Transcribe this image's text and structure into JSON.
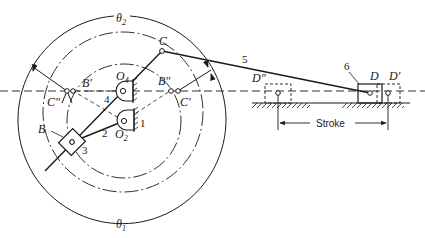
{
  "diagram": {
    "type": "kinematic mechanism (Whitworth quick-return)",
    "colors": {
      "ink": "#1a1a1a",
      "background": "#ffffff"
    },
    "angles": {
      "theta2": {
        "symbol": "θ",
        "subscript": "2"
      },
      "theta1": {
        "symbol": "θ",
        "subscript": "1"
      }
    },
    "points": {
      "C": "C",
      "C_double_prime": "C″",
      "C_prime": "C′",
      "B_prime": "B′",
      "B_double_prime": "B″",
      "B": "B",
      "O4": {
        "base": "O",
        "subscript": "4"
      },
      "O2": {
        "base": "O",
        "subscript": "2"
      },
      "D": "D",
      "D_prime": "D′",
      "D_double_prime": "D″"
    },
    "links": {
      "link1": "1",
      "link2": "2",
      "link3": "3",
      "link4": "4",
      "link5": "5",
      "link6": "6"
    },
    "stroke_label": "Stroke"
  }
}
